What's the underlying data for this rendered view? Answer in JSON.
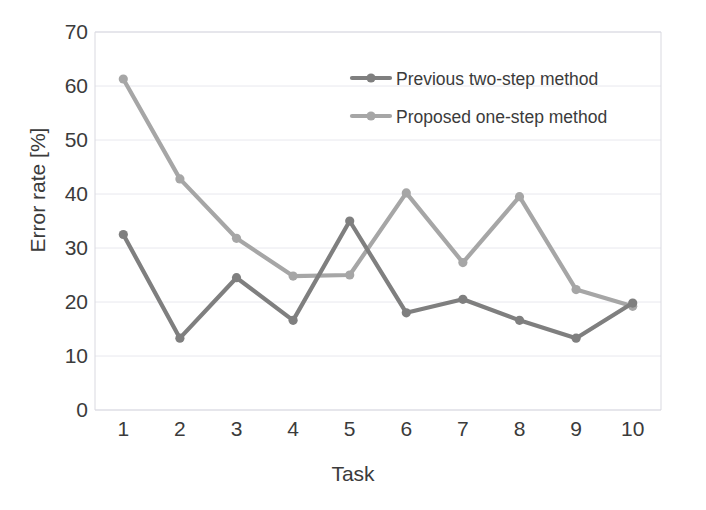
{
  "chart_data": {
    "type": "line",
    "title": "",
    "xlabel": "Task",
    "ylabel": "Error rate [%]",
    "categories": [
      "1",
      "2",
      "3",
      "4",
      "5",
      "6",
      "7",
      "8",
      "9",
      "10"
    ],
    "x": [
      1,
      2,
      3,
      4,
      5,
      6,
      7,
      8,
      9,
      10
    ],
    "xlim": [
      0.5,
      10.5
    ],
    "ylim": [
      0,
      70
    ],
    "yticks": [
      0,
      10,
      20,
      30,
      40,
      50,
      60,
      70
    ],
    "ytick_labels": [
      "0",
      "10",
      "20",
      "30",
      "40",
      "50",
      "60",
      "70"
    ],
    "grid": "horizontal",
    "legend_position": "upper-right-inside",
    "series": [
      {
        "name": "Previous two-step method",
        "color": "#7f7f7f",
        "marker": "circle",
        "values": [
          32.5,
          13.3,
          24.5,
          16.6,
          35.0,
          18.0,
          20.5,
          16.6,
          13.3,
          19.8
        ]
      },
      {
        "name": "Proposed one-step method",
        "color": "#a6a6a6",
        "marker": "circle",
        "values": [
          61.3,
          42.8,
          31.8,
          24.8,
          25.0,
          40.2,
          27.3,
          39.5,
          22.3,
          19.2
        ]
      }
    ]
  },
  "legend": {
    "items": [
      {
        "label": "Previous two-step method",
        "color": "#7f7f7f"
      },
      {
        "label": "Proposed one-step method",
        "color": "#a6a6a6"
      }
    ]
  },
  "colors": {
    "series_dark": "#7f7f7f",
    "series_light": "#a6a6a6",
    "grid": "#e8e8ee",
    "axis": "#d9d9e0",
    "text": "#3b3b3b",
    "background": "#ffffff"
  }
}
